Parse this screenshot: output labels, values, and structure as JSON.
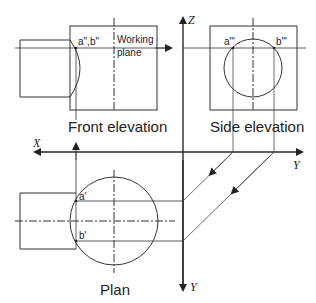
{
  "labels": {
    "front_elevation": "Front elevation",
    "side_elevation": "Side elevation",
    "plan": "Plan",
    "working_plane_1": "Working",
    "working_plane_2": "plane",
    "front_points": "a\",b\"",
    "side_point_a": "a\"'",
    "side_point_b": "b\"'",
    "plan_point_a": "a'",
    "plan_point_b": "b'"
  },
  "axes": {
    "z": "Z",
    "x": "X",
    "y_horizontal": "Y",
    "y_vertical": "Y"
  },
  "colors": {
    "line": "#2a2a2a",
    "thin": "#555555"
  }
}
